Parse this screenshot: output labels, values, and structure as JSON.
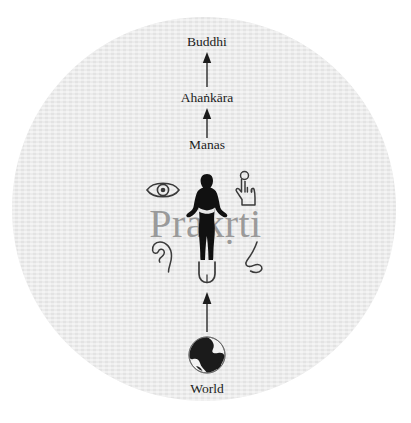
{
  "diagram": {
    "title_watermark": "Prakṛti",
    "background_circle_color": "#e9e9e9",
    "text_color": "#1b1b1b",
    "watermark_color": "#9a9a9a",
    "nodes": [
      {
        "id": "buddhi",
        "label": "Buddhi"
      },
      {
        "id": "ahankara",
        "label": "Ahaṅkāra"
      },
      {
        "id": "manas",
        "label": "Manas"
      },
      {
        "id": "world",
        "label": "World"
      }
    ],
    "arrows": [
      {
        "from": "ahankara",
        "to": "buddhi",
        "direction": "up"
      },
      {
        "from": "manas",
        "to": "ahankara",
        "direction": "up"
      },
      {
        "from": "world",
        "to": "senses",
        "direction": "up"
      }
    ],
    "sense_icons": [
      {
        "id": "eye",
        "name": "eye-icon",
        "sense": "sight"
      },
      {
        "id": "touch",
        "name": "hand-touch-icon",
        "sense": "touch"
      },
      {
        "id": "ear",
        "name": "ear-icon",
        "sense": "hearing"
      },
      {
        "id": "nose",
        "name": "nose-icon",
        "sense": "smell"
      },
      {
        "id": "tongue",
        "name": "tongue-icon",
        "sense": "taste"
      }
    ],
    "center_figure": {
      "name": "human-silhouette",
      "description": "person standing with hands on hips"
    },
    "bottom_figure": {
      "name": "globe-icon",
      "description": "earth globe"
    }
  }
}
